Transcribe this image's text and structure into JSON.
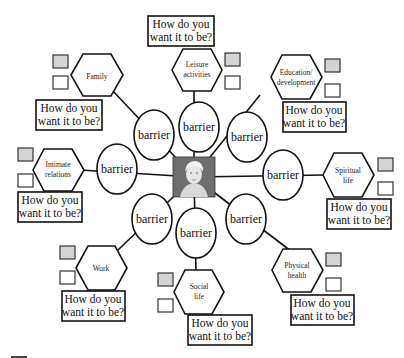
{
  "center": {
    "label": "person-portrait"
  },
  "barrier_label": "barrier",
  "question_line1": "How do you",
  "question_line2": "want it to be?",
  "colors": {
    "stroke": "#111111",
    "shaded_square": "#d4d4d4",
    "photo_bg": "#6e6e6e"
  },
  "domains": [
    {
      "id": "family",
      "line1": "Family",
      "line2": ""
    },
    {
      "id": "leisure",
      "line1": "Leisure",
      "line2": "activities"
    },
    {
      "id": "education",
      "line1": "Education/",
      "line2": "development"
    },
    {
      "id": "intimate",
      "line1": "Intimate",
      "line2": "relations"
    },
    {
      "id": "spiritual",
      "line1": "Spiritual",
      "line2": "life"
    },
    {
      "id": "work",
      "line1": "Work",
      "line2": ""
    },
    {
      "id": "social",
      "line1": "Social",
      "line2": "life"
    },
    {
      "id": "physical",
      "line1": "Physical",
      "line2": "health"
    }
  ]
}
